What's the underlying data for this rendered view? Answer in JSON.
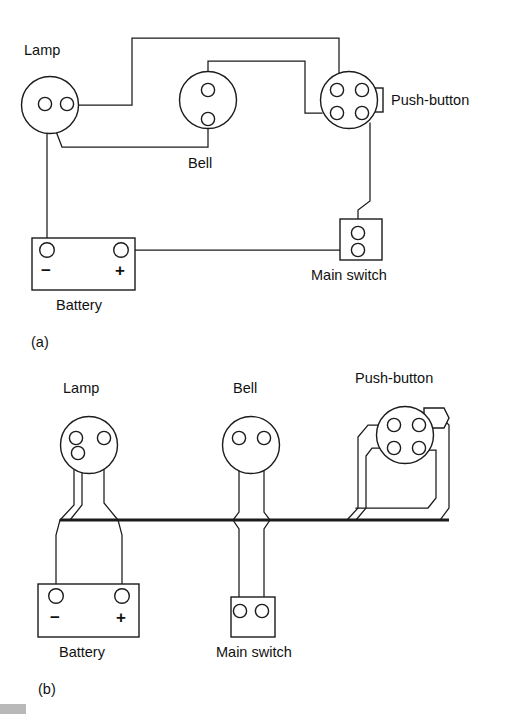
{
  "figure": {
    "line_color": "#1b1b1b",
    "background_color": "#ffffff"
  },
  "panels": [
    {
      "id": "a",
      "caption": "(a)",
      "caption_note": "point-to-point wiring",
      "components": [
        {
          "name": "lamp",
          "label": "Lamp",
          "shape": "circle",
          "terminals": 2
        },
        {
          "name": "bell",
          "label": "Bell",
          "shape": "circle",
          "terminals": 2
        },
        {
          "name": "push-button",
          "label": "Push-button",
          "shape": "circle",
          "terminals": 4
        },
        {
          "name": "battery",
          "label": "Battery",
          "shape": "rectangle",
          "terminals": 2,
          "terminal_labels": [
            "−",
            "+"
          ]
        },
        {
          "name": "main-switch",
          "label": "Main switch",
          "shape": "rectangle",
          "terminals": 2
        }
      ]
    },
    {
      "id": "b",
      "caption": "(b)",
      "caption_note": "harness / loom wiring",
      "components": [
        {
          "name": "lamp",
          "label": "Lamp",
          "shape": "circle",
          "terminals": 2
        },
        {
          "name": "bell",
          "label": "Bell",
          "shape": "circle",
          "terminals": 2
        },
        {
          "name": "push-button",
          "label": "Push-button",
          "shape": "circle",
          "terminals": 4
        },
        {
          "name": "battery",
          "label": "Battery",
          "shape": "rectangle",
          "terminals": 2,
          "terminal_labels": [
            "−",
            "+"
          ]
        },
        {
          "name": "main-switch",
          "label": "Main switch",
          "shape": "rectangle",
          "terminals": 2
        }
      ]
    }
  ],
  "labels": {
    "a": {
      "lamp": "Lamp",
      "bell": "Bell",
      "push_button": "Push-button",
      "battery": "Battery",
      "main_switch": "Main switch",
      "battery_minus": "−",
      "battery_plus": "+",
      "caption": "(a)"
    },
    "b": {
      "lamp": "Lamp",
      "bell": "Bell",
      "push_button": "Push-button",
      "battery": "Battery",
      "main_switch": "Main switch",
      "battery_minus": "−",
      "battery_plus": "+",
      "caption": "(b)"
    }
  }
}
